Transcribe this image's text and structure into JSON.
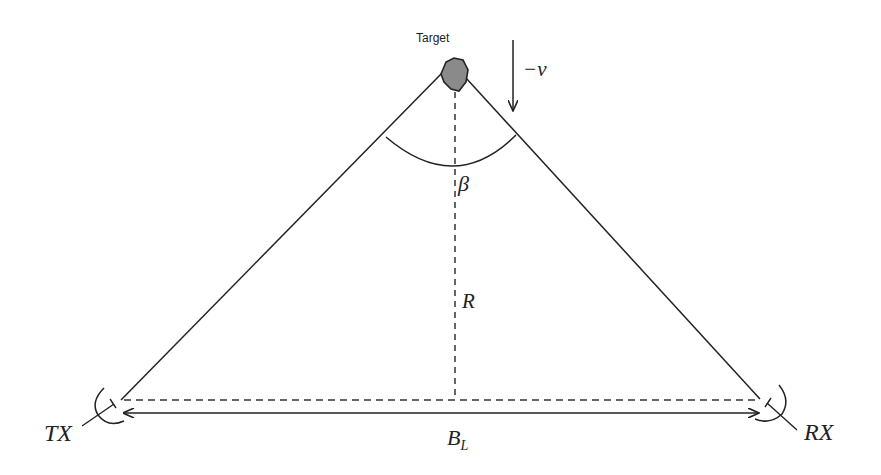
{
  "diagram": {
    "type": "bistatic-radar-geometry",
    "labels": {
      "target": "Target",
      "velocity": "−v",
      "bistatic_angle": "β",
      "range": "R",
      "baseline": "B",
      "baseline_subscript": "L",
      "transmitter": "TX",
      "receiver": "RX"
    },
    "nodes": [
      {
        "id": "target",
        "label": "Target",
        "x": 455,
        "y": 76
      },
      {
        "id": "tx",
        "label": "TX",
        "x": 120,
        "y": 400
      },
      {
        "id": "rx",
        "label": "RX",
        "x": 762,
        "y": 400
      }
    ],
    "edges": [
      {
        "from": "tx",
        "to": "target",
        "style": "solid"
      },
      {
        "from": "target",
        "to": "rx",
        "style": "solid"
      },
      {
        "from": "tx",
        "to": "rx",
        "style": "dashed"
      },
      {
        "from": "target",
        "to": "baseline-foot",
        "style": "dashed",
        "label": "R"
      },
      {
        "from": "tx",
        "to": "rx",
        "style": "double-arrow",
        "label": "B_L"
      }
    ],
    "colors": {
      "stroke": "#222222",
      "target_fill": "#8a8a8a",
      "background": "#ffffff"
    }
  }
}
